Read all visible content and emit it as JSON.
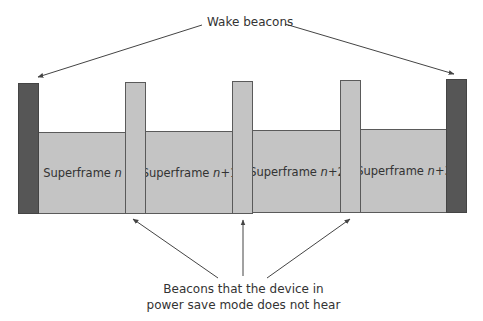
{
  "diagram": {
    "top_label": "Wake beacons",
    "bottom_label_line1": "Beacons that the device in",
    "bottom_label_line2": "power save mode does not hear",
    "superframes": [
      {
        "prefix": "Superframe ",
        "index": "n",
        "suffix": ""
      },
      {
        "prefix": "Superframe ",
        "index": "n",
        "suffix": "+1"
      },
      {
        "prefix": "Superframe ",
        "index": "n",
        "suffix": "+2"
      },
      {
        "prefix": "Superframe ",
        "index": "n",
        "suffix": "+3"
      }
    ],
    "colors": {
      "wake_beacon": "#565656",
      "beacon": "#c4c4c4",
      "superframe": "#c4c4c4",
      "outline": "#5a5a5a",
      "arrow": "#444444"
    }
  }
}
